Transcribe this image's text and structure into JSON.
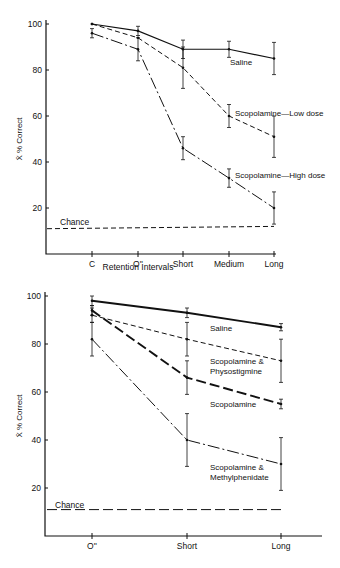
{
  "chart_data": [
    {
      "type": "line",
      "title": "",
      "xlabel": "Retention Intervals",
      "ylabel": "X̄ % Correct",
      "ylim": [
        0,
        100
      ],
      "yticks": [
        20,
        40,
        60,
        80,
        100
      ],
      "categories": [
        "C",
        "O''",
        "Short",
        "Medium",
        "Long"
      ],
      "grid": false,
      "series": [
        {
          "name": "Saline",
          "style": "solid",
          "width": 1.1,
          "values": [
            100,
            97,
            89,
            89,
            85
          ],
          "err": [
            0,
            2,
            4,
            3.5,
            7
          ],
          "label_pos": [
            230,
            65
          ]
        },
        {
          "name": "Scopolamine—Low dose",
          "style": "dashed",
          "width": 1.0,
          "values": [
            100,
            94,
            81,
            60,
            51
          ],
          "err": [
            0,
            0,
            9,
            5,
            9
          ],
          "label_pos": [
            235,
            116
          ]
        },
        {
          "name": "Scopolamine—High dose",
          "style": "dashdot",
          "width": 1.0,
          "values": [
            96,
            89,
            46,
            33,
            20
          ],
          "err": [
            2,
            5,
            5,
            4,
            7
          ],
          "label_pos": [
            235,
            178
          ]
        }
      ],
      "reference": {
        "name": "Chance",
        "values": [
          11,
          12
        ],
        "style": "dashed"
      }
    },
    {
      "type": "line",
      "title": "",
      "xlabel": "",
      "ylabel": "X̄ % Correct",
      "ylim": [
        0,
        100
      ],
      "yticks": [
        20,
        40,
        60,
        80,
        100
      ],
      "categories": [
        "O''",
        "Short",
        "Long"
      ],
      "grid": false,
      "series": [
        {
          "name": "Saline",
          "lines": [
            "Saline"
          ],
          "style": "solid",
          "width": 1.9,
          "values": [
            98,
            93,
            87
          ],
          "err": [
            2,
            2,
            1.5
          ],
          "label_pos": [
            210,
            331
          ]
        },
        {
          "name": "Scopolamine & Physostigmine",
          "lines": [
            "Scopolamine &",
            "Physostigmine"
          ],
          "style": "dashed",
          "width": 1.0,
          "values": [
            92,
            82,
            73
          ],
          "err": [
            3,
            7,
            9
          ],
          "label_pos": [
            210,
            364
          ]
        },
        {
          "name": "Scopolamine",
          "lines": [
            "Scopolamine"
          ],
          "style": "longdash",
          "width": 1.9,
          "values": [
            94,
            66,
            55
          ],
          "err": [
            2,
            7,
            2
          ],
          "label_pos": [
            210,
            407
          ]
        },
        {
          "name": "Scopolamine & Methylphenidate",
          "lines": [
            "Scopolamine &",
            "Methylphenidate"
          ],
          "style": "dashdot",
          "width": 1.0,
          "values": [
            82,
            40,
            30
          ],
          "err": [
            7,
            11,
            11
          ],
          "label_pos": [
            210,
            470
          ]
        }
      ],
      "reference": {
        "name": "Chance",
        "values": [
          11,
          11
        ],
        "style": "longdash"
      }
    }
  ]
}
